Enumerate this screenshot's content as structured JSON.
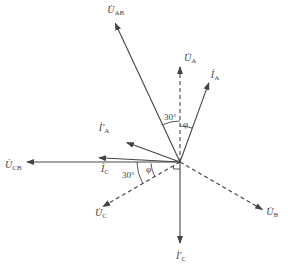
{
  "diagram": {
    "type": "phasor-diagram",
    "phasors": [
      {
        "id": "U_AB",
        "symbol": "U",
        "sub": "AB",
        "prime": false,
        "style": "solid",
        "angle_deg": 115,
        "magnitude": 1.0
      },
      {
        "id": "U_A",
        "symbol": "U",
        "sub": "A",
        "prime": false,
        "style": "dashed",
        "angle_deg": 90,
        "magnitude": 0.62
      },
      {
        "id": "I_A",
        "symbol": "I",
        "sub": "A",
        "prime": false,
        "style": "solid",
        "angle_deg": 70,
        "magnitude": 0.55
      },
      {
        "id": "I_A_p",
        "symbol": "I",
        "sub": "A",
        "prime": true,
        "style": "solid",
        "angle_deg": 160,
        "magnitude": 0.37
      },
      {
        "id": "U_CB",
        "symbol": "U",
        "sub": "CB",
        "prime": false,
        "style": "solid",
        "angle_deg": 180,
        "magnitude": 1.0
      },
      {
        "id": "I_C",
        "symbol": "I",
        "sub": "C",
        "prime": false,
        "style": "solid",
        "angle_deg": 177,
        "magnitude": 0.53
      },
      {
        "id": "U_C",
        "symbol": "U",
        "sub": "C",
        "prime": false,
        "style": "dashed",
        "angle_deg": 210,
        "magnitude": 0.58
      },
      {
        "id": "U_B",
        "symbol": "U",
        "sub": "B",
        "prime": false,
        "style": "dashed",
        "angle_deg": 330,
        "magnitude": 0.62
      },
      {
        "id": "I_C_p",
        "symbol": "I",
        "sub": "C",
        "prime": true,
        "style": "solid",
        "angle_deg": 270,
        "magnitude": 0.53
      }
    ],
    "angle_labels": [
      {
        "id": "upper-30",
        "text": "30°"
      },
      {
        "id": "upper-phi",
        "text": "φ"
      },
      {
        "id": "lower-30",
        "text": "30°"
      },
      {
        "id": "lower-phi",
        "text": "φ"
      }
    ],
    "right_angle_marker": true
  }
}
